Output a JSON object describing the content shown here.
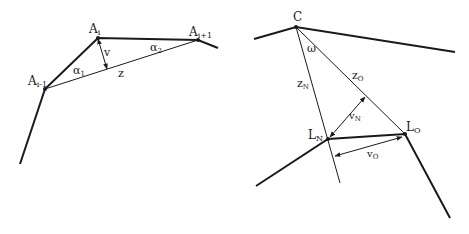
{
  "left_diagram": {
    "labels": {
      "a_prev": "A",
      "a_prev_sub": "i-1",
      "a_curr": "A",
      "a_curr_sub": "i",
      "a_next": "A",
      "a_next_sub": "i+1",
      "v": "v",
      "z": "z",
      "alpha1": "α",
      "alpha1_sub": "1",
      "alpha2": "α",
      "alpha2_sub": "2"
    }
  },
  "right_diagram": {
    "labels": {
      "c": "C",
      "omega": "ω",
      "z_n": "z",
      "z_n_sub": "N",
      "z_o": "z",
      "z_o_sub": "O",
      "v_n": "v",
      "v_n_sub": "N",
      "v_o": "v",
      "v_o_sub": "O",
      "l_n": "L",
      "l_n_sub": "N",
      "l_o": "L",
      "l_o_sub": "O"
    }
  },
  "colors": {
    "stroke": "#1a1a1a",
    "background": "#ffffff"
  }
}
